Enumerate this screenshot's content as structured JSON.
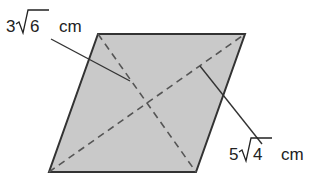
{
  "figure": {
    "shape": "rhombus",
    "fill_color": "#c9c9c9",
    "edge_color": "#333333",
    "vertices": {
      "top_left": [
        98,
        34
      ],
      "top_right": [
        245,
        34
      ],
      "bottom_right": [
        196,
        172
      ],
      "bottom_left": [
        49,
        172
      ]
    },
    "diagonals": [
      {
        "name": "short-diagonal",
        "from": "top_left",
        "to": "bottom_right",
        "style": "dashed"
      },
      {
        "name": "long-diagonal",
        "from": "bottom_left",
        "to": "top_right",
        "style": "dashed"
      }
    ]
  },
  "labels": {
    "short_diagonal": {
      "coefficient": "3",
      "radicand": "6",
      "unit": "cm",
      "text": "3√6 cm"
    },
    "long_diagonal": {
      "coefficient": "5",
      "radicand": "4",
      "unit": "cm",
      "text": "5√4 cm"
    }
  }
}
